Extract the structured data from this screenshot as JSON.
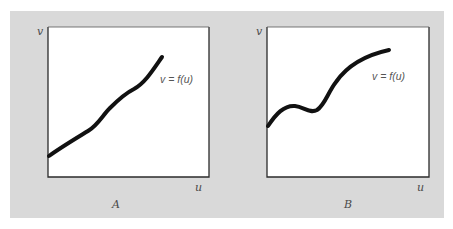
{
  "figure": {
    "background_color": "#d9d9d9",
    "plot_background": "#ffffff",
    "axis_color": "#2b2b2b",
    "curve_color": "#111111",
    "panels": [
      {
        "id": "A",
        "caption": "A",
        "x_axis_label": "u",
        "y_axis_label": "v",
        "curve_label": "v = f(u)",
        "description": "Monotonically increasing, nearly linear wavy curve"
      },
      {
        "id": "B",
        "caption": "B",
        "x_axis_label": "u",
        "y_axis_label": "v",
        "curve_label": "v = f(u)",
        "description": "Increasing curve with a local bump and dip (non-monotonic) before rising and leveling off"
      }
    ]
  }
}
